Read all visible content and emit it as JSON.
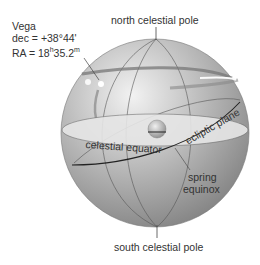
{
  "diagram": {
    "labels": {
      "north_pole": "north celestial pole",
      "south_pole": "south celestial pole",
      "celestial_equator": "celestial equator",
      "ecliptic_plane": "ecliptic plane",
      "spring_equinox_line1": "spring",
      "spring_equinox_line2": "equinox"
    },
    "star": {
      "name": "Vega",
      "dec": "dec = +38°44'",
      "ra_prefix": "RA = 18",
      "ra_h": "h",
      "ra_mid": "35.2",
      "ra_m": "m"
    },
    "colors": {
      "sphere_light": "#e8e8e8",
      "sphere_dark": "#8a8a8a",
      "equator_plane": "#e4e4e4",
      "lines": "#333333",
      "text": "#333333"
    }
  }
}
